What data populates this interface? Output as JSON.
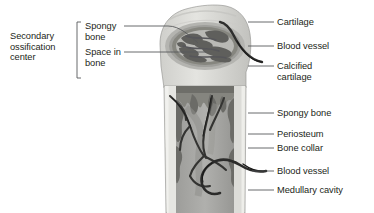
{
  "figure": {
    "background_color": "#ffffff",
    "text_color": "#231f20",
    "leader_color": "#58595b"
  },
  "left_labels": {
    "bracket_title": "Secondary\nossification\ncenter",
    "bracket_title_lines": [
      "Secondary",
      "ossification",
      "center"
    ],
    "items": [
      {
        "label": "Spongy\nbone",
        "lines": [
          "Spongy",
          "bone"
        ]
      },
      {
        "label": "Space in\nbone",
        "lines": [
          "Space in",
          "bone"
        ]
      }
    ]
  },
  "right_labels": [
    {
      "label": "Cartilage"
    },
    {
      "label": "Blood vessel"
    },
    {
      "label": "Calcified\ncartilage",
      "lines": [
        "Calcified",
        "cartilage"
      ]
    },
    {
      "label": "Spongy bone"
    },
    {
      "label": "Periosteum"
    },
    {
      "label": "Bone collar"
    },
    {
      "label": "Blood vessel"
    },
    {
      "label": "Medullary cavity"
    }
  ],
  "illustration": {
    "name": "long-bone-longitudinal-section",
    "regions": [
      {
        "name": "articular-cartilage-cap",
        "tone": "#d8d8d6"
      },
      {
        "name": "epiphysis",
        "tone": "#c9c9c6"
      },
      {
        "name": "secondary-ossification-center",
        "tone": "#6f6f6d"
      },
      {
        "name": "spongy-bone-trabeculae",
        "tone": "#7a7a78"
      },
      {
        "name": "calcified-cartilage-zone",
        "tone": "#8a8a87"
      },
      {
        "name": "bone-collar",
        "tone": "#dededa"
      },
      {
        "name": "periosteum",
        "tone": "#ebebe8"
      },
      {
        "name": "medullary-cavity",
        "tone": "#a3a3a0"
      },
      {
        "name": "blood-vessels",
        "tone": "#3a3a38"
      }
    ]
  }
}
